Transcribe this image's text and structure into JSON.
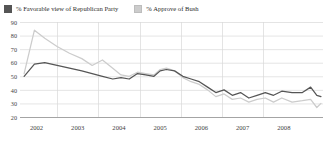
{
  "legend": {
    "position": "top-left",
    "items": [
      {
        "label": "% Favorable view of Republican Party",
        "color": "#555555",
        "swatch_name": "legend-swatch-republican"
      },
      {
        "label": "% Approve of Bush",
        "color": "#cccccc",
        "swatch_name": "legend-swatch-bush"
      }
    ]
  },
  "axes": {
    "y_ticks": [
      "90",
      "80",
      "70",
      "60",
      "50",
      "40",
      "30",
      "20"
    ],
    "x_ticks": [
      "2002",
      "2003",
      "2004",
      "2005",
      "2006",
      "2007",
      "2008"
    ]
  },
  "chart_data": {
    "type": "line",
    "title": "",
    "subtitle": "",
    "xlabel": "",
    "ylabel": "",
    "ylim": [
      20,
      90
    ],
    "xlim": [
      2001.6,
      2008.95
    ],
    "grid": true,
    "legend_position": "top-left",
    "x_tick_labels": [
      "2002",
      "2003",
      "2004",
      "2005",
      "2006",
      "2007",
      "2008"
    ],
    "x_tick_values": [
      2002,
      2003,
      2004,
      2005,
      2006,
      2007,
      2008
    ],
    "y_tick_values": [
      90,
      80,
      70,
      60,
      50,
      40,
      30,
      20
    ],
    "series": [
      {
        "name": "% Favorable view of Republican Party",
        "color": "#555555",
        "x": [
          2001.7,
          2001.95,
          2002.2,
          2002.5,
          2002.8,
          2003.1,
          2003.35,
          2003.6,
          2003.85,
          2004.05,
          2004.25,
          2004.45,
          2004.65,
          2004.85,
          2005.0,
          2005.15,
          2005.35,
          2005.55,
          2005.75,
          2005.95,
          2006.15,
          2006.35,
          2006.55,
          2006.75,
          2006.95,
          2007.15,
          2007.35,
          2007.55,
          2007.75,
          2007.95,
          2008.2,
          2008.45,
          2008.65,
          2008.8,
          2008.9
        ],
        "y": [
          50,
          59,
          60,
          58,
          56,
          54,
          52,
          50,
          48,
          49,
          48,
          52,
          51,
          50,
          54,
          55,
          54,
          50,
          48,
          46,
          42,
          38,
          40,
          36,
          38,
          34,
          36,
          38,
          36,
          39,
          38,
          38,
          42,
          36,
          35
        ]
      },
      {
        "name": "% Approve of Bush",
        "color": "#cccccc",
        "x": [
          2001.7,
          2001.95,
          2002.2,
          2002.5,
          2002.8,
          2003.1,
          2003.35,
          2003.6,
          2003.85,
          2004.05,
          2004.25,
          2004.45,
          2004.65,
          2004.85,
          2005.0,
          2005.15,
          2005.35,
          2005.55,
          2005.75,
          2005.95,
          2006.15,
          2006.35,
          2006.55,
          2006.75,
          2006.95,
          2007.15,
          2007.35,
          2007.55,
          2007.75,
          2007.95,
          2008.2,
          2008.45,
          2008.65,
          2008.8,
          2008.9
        ],
        "y": [
          52,
          84,
          78,
          72,
          67,
          63,
          58,
          62,
          56,
          51,
          50,
          53,
          52,
          51,
          55,
          56,
          54,
          49,
          46,
          44,
          40,
          35,
          37,
          33,
          34,
          31,
          33,
          34,
          31,
          34,
          31,
          32,
          33,
          27,
          30
        ]
      }
    ]
  }
}
